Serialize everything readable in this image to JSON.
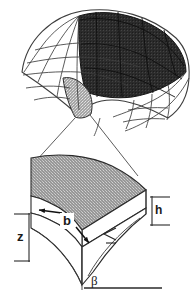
{
  "figure": {
    "background_color": "#ffffff",
    "line_color": "#3a3a3a",
    "width": 195,
    "height": 297
  },
  "upper_view": {
    "name": "meshed curved shell surface",
    "regions": [
      {
        "id": "white-mesh",
        "fill": "#ffffff",
        "description": "unshaded curvilinear mesh"
      },
      {
        "id": "dark-shaded-fan",
        "fill": "#2b2b2b",
        "description": "dark shaded fan-shaped patch region"
      },
      {
        "id": "light-stippled-patch",
        "fill": "#b8b8b8",
        "description": "highlighted single element, magnified below"
      }
    ]
  },
  "leader_lines": {
    "name": "magnification leader lines",
    "count": 2,
    "description": "connect highlighted element to enlarged detail"
  },
  "lower_view": {
    "name": "magnified 3D wedge element",
    "top_face_fill": "#9a9a9a",
    "side_face_fill": "#ffffff",
    "labels": {
      "b": "b",
      "z": "z",
      "h": "h",
      "beta": "β",
      "angle": "∢"
    }
  },
  "dimensions": [
    {
      "symbol": "b",
      "meaning": "element width, double arrow across top face"
    },
    {
      "symbol": "z",
      "meaning": "left edge vertical extent with tick marks"
    },
    {
      "symbol": "h",
      "meaning": "element thickness at right edge"
    },
    {
      "symbol": "β",
      "meaning": "angle at lower apex against baseline"
    }
  ]
}
